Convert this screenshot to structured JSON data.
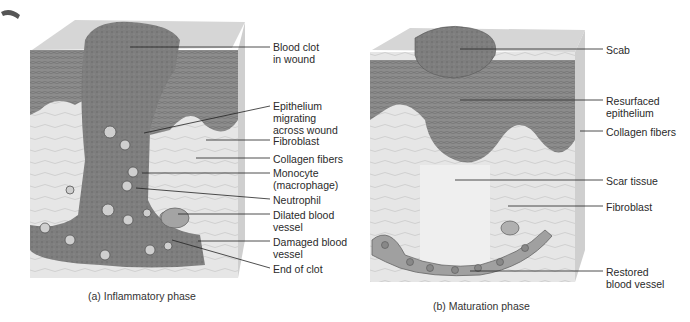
{
  "panel_a": {
    "caption": "(a) Inflammatory phase",
    "labels": [
      {
        "id": "blood-clot",
        "text": "Blood clot\nin wound"
      },
      {
        "id": "epithelium-migrating",
        "text": "Epithelium\nmigrating\nacross wound"
      },
      {
        "id": "fibroblast",
        "text": "Fibroblast"
      },
      {
        "id": "collagen-fibers",
        "text": "Collagen fibers"
      },
      {
        "id": "monocyte",
        "text": "Monocyte\n(macrophage)"
      },
      {
        "id": "neutrophil",
        "text": "Neutrophil"
      },
      {
        "id": "dilated-vessel",
        "text": "Dilated blood\nvessel"
      },
      {
        "id": "damaged-vessel",
        "text": "Damaged blood\nvessel"
      },
      {
        "id": "end-of-clot",
        "text": "End of clot"
      }
    ]
  },
  "panel_b": {
    "caption": "(b) Maturation phase",
    "labels": [
      {
        "id": "scab",
        "text": "Scab"
      },
      {
        "id": "resurfaced-epithelium",
        "text": "Resurfaced\nepithelium"
      },
      {
        "id": "collagen-fibers",
        "text": "Collagen fibers"
      },
      {
        "id": "scar-tissue",
        "text": "Scar tissue"
      },
      {
        "id": "fibroblast",
        "text": "Fibroblast"
      },
      {
        "id": "restored-vessel",
        "text": "Restored\nblood vessel"
      }
    ]
  },
  "colors": {
    "epidermis": "#8a8a8a",
    "dermis": "#e2e2e2",
    "clot": "#7a7a7a",
    "vessel": "#9a9a9a",
    "surface": "#d8d8d8",
    "leader": "#222222"
  }
}
